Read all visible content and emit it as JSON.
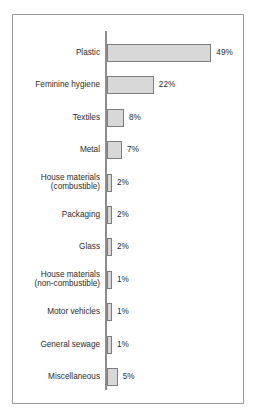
{
  "chart_data": {
    "type": "bar",
    "orientation": "horizontal",
    "title": "",
    "subtitle": "",
    "xlabel": "",
    "ylabel": "",
    "grid": false,
    "legend": null,
    "axis_visible": true,
    "xlim": [
      0,
      49
    ],
    "unit": "%",
    "colors": {
      "bar_fill": "#d8d8d8",
      "bar_border": "#7d7d7d",
      "axis": "#8e8e8e",
      "frame": "#9b9b9b",
      "text": "#2b2b2b",
      "background": "#ffffff"
    },
    "categories": [
      "Plastic",
      "Feminine hygiene",
      "Textiles",
      "Metal",
      "House materials\n(combustible)",
      "Packaging",
      "Glass",
      "House materials\n(non-combustible)",
      "Motor vehicles",
      "General sewage",
      "Miscellaneous"
    ],
    "values": [
      49,
      22,
      8,
      7,
      2,
      2,
      2,
      1,
      1,
      1,
      5
    ],
    "value_labels": [
      "49%",
      "22%",
      "8%",
      "7%",
      "2%",
      "2%",
      "2%",
      "1%",
      "1%",
      "1%",
      "5%"
    ],
    "points": [
      {
        "category": "Plastic",
        "value": 49,
        "label": "49%",
        "lines": 1
      },
      {
        "category": "Feminine hygiene",
        "value": 22,
        "label": "22%",
        "lines": 1
      },
      {
        "category": "Textiles",
        "value": 8,
        "label": "8%",
        "lines": 1
      },
      {
        "category": "Metal",
        "value": 7,
        "label": "7%",
        "lines": 1
      },
      {
        "category": "House materials\n(combustible)",
        "value": 2,
        "label": "2%",
        "lines": 2
      },
      {
        "category": "Packaging",
        "value": 2,
        "label": "2%",
        "lines": 1
      },
      {
        "category": "Glass",
        "value": 2,
        "label": "2%",
        "lines": 1
      },
      {
        "category": "House materials\n(non-combustible)",
        "value": 1,
        "label": "1%",
        "lines": 2
      },
      {
        "category": "Motor vehicles",
        "value": 1,
        "label": "1%",
        "lines": 1
      },
      {
        "category": "General sewage",
        "value": 1,
        "label": "1%",
        "lines": 1
      },
      {
        "category": "Miscellaneous",
        "value": 5,
        "label": "5%",
        "lines": 1
      }
    ]
  }
}
